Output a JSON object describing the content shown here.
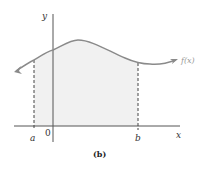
{
  "figure": {
    "caption": "(b)",
    "function_label": "f(x)",
    "axes": {
      "x_label": "x",
      "y_label": "y",
      "origin_label": "0"
    },
    "interval": {
      "left_label": "a",
      "right_label": "b",
      "shaded": true
    },
    "colors": {
      "curve": "#8a8a8a",
      "axis": "#555555",
      "shade": "#f0f0f0",
      "dashed": "#444444"
    }
  }
}
